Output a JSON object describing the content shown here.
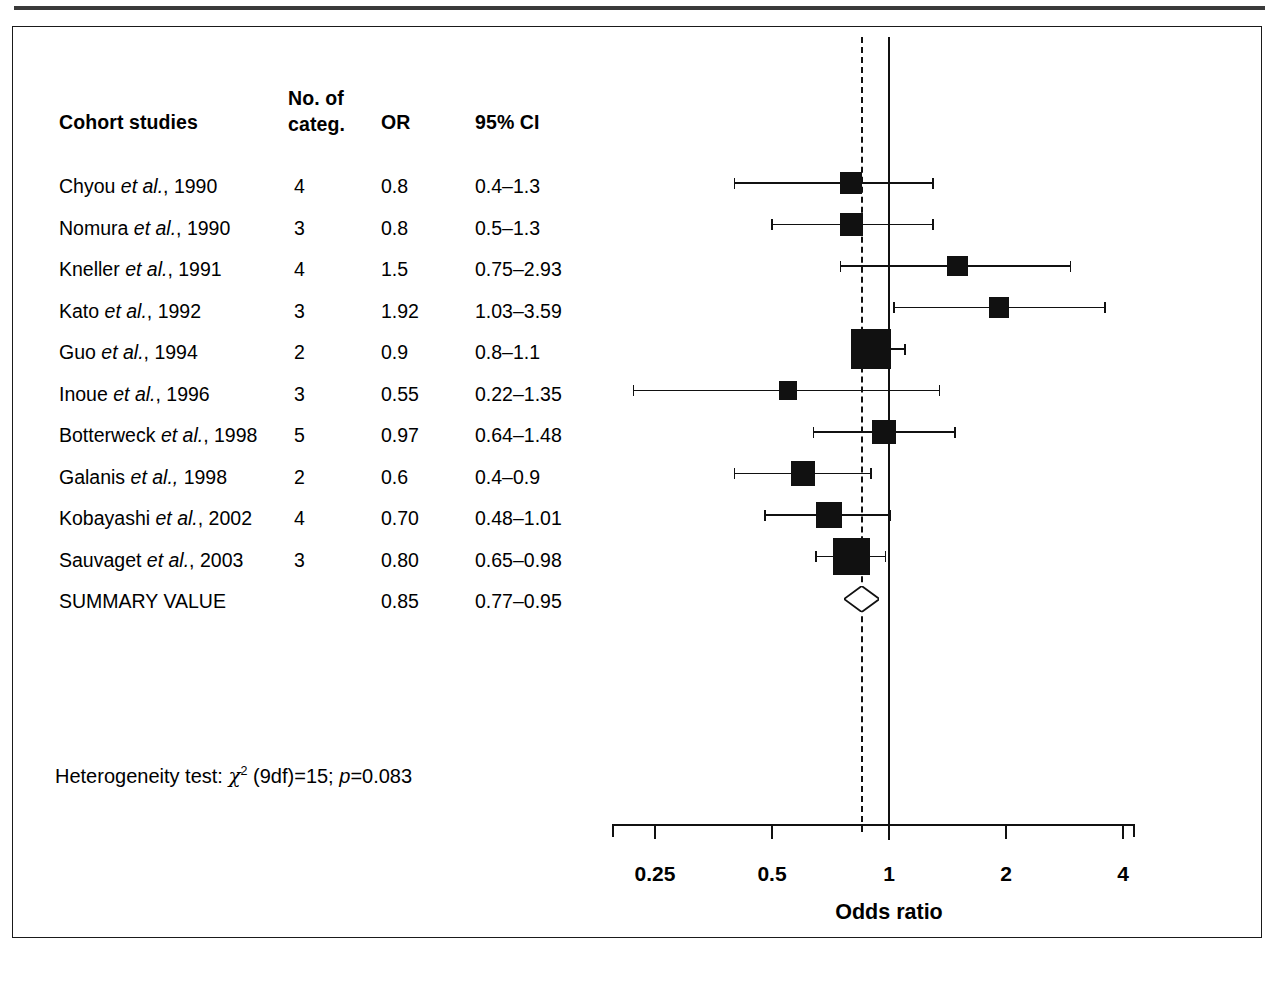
{
  "figure": {
    "panel_label": "forest-plot-cohort-studies"
  },
  "table": {
    "headers": {
      "study": "Cohort studies",
      "categories_line1": "No. of",
      "categories_line2": "categ.",
      "or": "OR",
      "ci": "95% CI"
    },
    "rows": [
      {
        "author": "Chyou",
        "etal": "et al.",
        "year": ", 1990",
        "categ": "4",
        "or": "0.8",
        "ci": "0.4–1.3"
      },
      {
        "author": "Nomura",
        "etal": "et al.",
        "year": ", 1990",
        "categ": "3",
        "or": "0.8",
        "ci": "0.5–1.3"
      },
      {
        "author": "Kneller",
        "etal": "et al.",
        "year": ", 1991",
        "categ": "4",
        "or": "1.5",
        "ci": "0.75–2.93"
      },
      {
        "author": "Kato",
        "etal": "et al.",
        "year": ", 1992",
        "categ": "3",
        "or": "1.92",
        "ci": "1.03–3.59"
      },
      {
        "author": "Guo",
        "etal": "et al.",
        "year": ", 1994",
        "categ": "2",
        "or": "0.9",
        "ci": "0.8–1.1"
      },
      {
        "author": "Inoue",
        "etal": "et al.",
        "year": ", 1996",
        "categ": "3",
        "or": "0.55",
        "ci": "0.22–1.35"
      },
      {
        "author": "Botterweck",
        "etal": "et al.",
        "year": ", 1998",
        "categ": "5",
        "or": "0.97",
        "ci": "0.64–1.48"
      },
      {
        "author": "Galanis",
        "etal": "et al.,",
        "year": " 1998",
        "categ": "2",
        "or": "0.6",
        "ci": "0.4–0.9"
      },
      {
        "author": "Kobayashi",
        "etal": "et al.",
        "year": ", 2002",
        "categ": "4",
        "or": "0.70",
        "ci": "0.48–1.01"
      },
      {
        "author": "Sauvaget",
        "etal": "et al.",
        "year": ", 2003",
        "categ": "3",
        "or": "0.80",
        "ci": "0.65–0.98"
      }
    ],
    "summary": {
      "label": "SUMMARY VALUE",
      "categ": "",
      "or": "0.85",
      "ci": "0.77–0.95"
    },
    "heterogeneity": {
      "prefix": "Heterogeneity test:",
      "chi": "χ",
      "chi_exp": "2",
      "df": " (9df)=15;",
      "p_italic": "p",
      "p_value": "=0.083"
    }
  },
  "chart_data": {
    "type": "forest",
    "title": "",
    "xlabel": "Odds ratio",
    "ylabel": "",
    "xscale": "log",
    "xlim": [
      0.2,
      4.6
    ],
    "ticks": [
      0.25,
      0.5,
      1,
      2,
      4
    ],
    "tick_labels": [
      "0.25",
      "0.5",
      "1",
      "2",
      "4"
    ],
    "reference_line": 1,
    "summary_line": 0.85,
    "grid": false,
    "legend": "none",
    "marker_color": "#111111",
    "studies": [
      {
        "label": "Chyou et al., 1990",
        "or": 0.8,
        "lo": 0.4,
        "hi": 1.3,
        "weight": 0.3
      },
      {
        "label": "Nomura et al., 1990",
        "or": 0.8,
        "lo": 0.5,
        "hi": 1.3,
        "weight": 0.34
      },
      {
        "label": "Kneller et al., 1991",
        "or": 1.5,
        "lo": 0.75,
        "hi": 2.93,
        "weight": 0.26
      },
      {
        "label": "Kato et al., 1992",
        "or": 1.92,
        "lo": 1.03,
        "hi": 3.59,
        "weight": 0.26
      },
      {
        "label": "Guo et al., 1994",
        "or": 0.9,
        "lo": 0.8,
        "hi": 1.1,
        "weight": 1.0
      },
      {
        "label": "Inoue et al., 1996",
        "or": 0.55,
        "lo": 0.22,
        "hi": 1.35,
        "weight": 0.18
      },
      {
        "label": "Botterweck et al., 1998",
        "or": 0.97,
        "lo": 0.64,
        "hi": 1.48,
        "weight": 0.36
      },
      {
        "label": "Galanis et al., 1998",
        "or": 0.6,
        "lo": 0.4,
        "hi": 0.9,
        "weight": 0.4
      },
      {
        "label": "Kobayashi et al., 2002",
        "or": 0.7,
        "lo": 0.48,
        "hi": 1.01,
        "weight": 0.44
      },
      {
        "label": "Sauvaget et al., 2003",
        "or": 0.8,
        "lo": 0.65,
        "hi": 0.98,
        "weight": 0.86
      }
    ],
    "summary": {
      "label": "SUMMARY VALUE",
      "or": 0.85,
      "lo": 0.77,
      "hi": 0.95,
      "shape": "diamond",
      "filled": false
    },
    "heterogeneity_text": "Heterogeneity test: χ2 (9df)=15; p=0.083"
  }
}
